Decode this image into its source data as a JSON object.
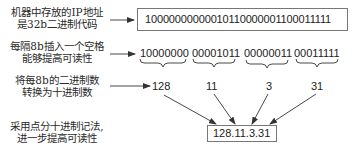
{
  "labels": {
    "step1": {
      "line1": "机器中存放的IP地址",
      "line2": "是32b二进制代码"
    },
    "step2": {
      "line1": "每隔8b插入一个空格",
      "line2": "能够提高可读性"
    },
    "step3": {
      "line1": "将每8b的二进制数",
      "line2": "转换为十进制数"
    },
    "step4": {
      "line1": "采用点分十进制记法,",
      "line2": "进一步提高可读性"
    }
  },
  "binary_full": "10000000000010110000001100011111",
  "bytes": [
    {
      "binary": "10000000",
      "decimal": "128"
    },
    {
      "binary": "00001011",
      "decimal": "11"
    },
    {
      "binary": "00000011",
      "decimal": "3"
    },
    {
      "binary": "00011111",
      "decimal": "31"
    }
  ],
  "dotted_decimal": "128.11.3.31",
  "colors": {
    "line": "#333333",
    "box_border": "#777777",
    "text": "#222222"
  }
}
